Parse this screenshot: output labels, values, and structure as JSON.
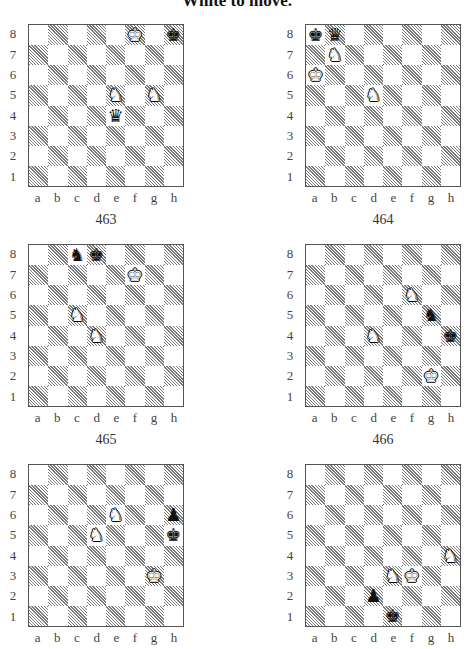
{
  "page": {
    "title": "White to move."
  },
  "labels": {
    "ranks": [
      "8",
      "7",
      "6",
      "5",
      "4",
      "3",
      "2",
      "1"
    ],
    "files": [
      "a",
      "b",
      "c",
      "d",
      "e",
      "f",
      "g",
      "h"
    ]
  },
  "piece_glyphs": {
    "white_king": "♔",
    "white_queen": "♕",
    "white_rook": "♖",
    "white_bishop": "♗",
    "white_knight": "♘",
    "white_pawn": "♙",
    "black_king": "♚",
    "black_queen": "♛",
    "black_rook": "♜",
    "black_bishop": "♝",
    "black_knight": "♞",
    "black_pawn": "♟"
  },
  "colors": {
    "light_square": "#ffffff",
    "dark_square_hatch": "#7a7a7a",
    "border": "#555555",
    "text": "#333333"
  },
  "diagrams": [
    {
      "number": "463",
      "position": {
        "left": 0,
        "top": 24
      },
      "pieces": [
        {
          "square": "f8",
          "piece": "white_king"
        },
        {
          "square": "h8",
          "piece": "black_king"
        },
        {
          "square": "e5",
          "piece": "white_knight"
        },
        {
          "square": "g5",
          "piece": "white_knight"
        },
        {
          "square": "e4",
          "piece": "black_queen"
        }
      ]
    },
    {
      "number": "464",
      "position": {
        "left": 277,
        "top": 24
      },
      "pieces": [
        {
          "square": "a8",
          "piece": "black_king"
        },
        {
          "square": "b8",
          "piece": "black_queen"
        },
        {
          "square": "b7",
          "piece": "white_knight"
        },
        {
          "square": "a6",
          "piece": "white_king"
        },
        {
          "square": "d5",
          "piece": "white_knight"
        }
      ]
    },
    {
      "number": "465",
      "position": {
        "left": 0,
        "top": 244
      },
      "pieces": [
        {
          "square": "c8",
          "piece": "black_knight"
        },
        {
          "square": "d8",
          "piece": "black_king"
        },
        {
          "square": "f7",
          "piece": "white_king"
        },
        {
          "square": "c5",
          "piece": "white_knight"
        },
        {
          "square": "d4",
          "piece": "white_knight"
        }
      ]
    },
    {
      "number": "466",
      "position": {
        "left": 277,
        "top": 244
      },
      "pieces": [
        {
          "square": "f6",
          "piece": "white_knight"
        },
        {
          "square": "g5",
          "piece": "black_knight"
        },
        {
          "square": "d4",
          "piece": "white_knight"
        },
        {
          "square": "h4",
          "piece": "black_king"
        },
        {
          "square": "g2",
          "piece": "white_king"
        }
      ]
    },
    {
      "number": "",
      "position": {
        "left": 0,
        "top": 464
      },
      "pieces": [
        {
          "square": "e6",
          "piece": "white_knight"
        },
        {
          "square": "h6",
          "piece": "black_pawn"
        },
        {
          "square": "d5",
          "piece": "white_knight"
        },
        {
          "square": "h5",
          "piece": "black_king"
        },
        {
          "square": "g3",
          "piece": "white_king"
        }
      ]
    },
    {
      "number": "",
      "position": {
        "left": 277,
        "top": 464
      },
      "pieces": [
        {
          "square": "h4",
          "piece": "white_knight"
        },
        {
          "square": "e3",
          "piece": "white_knight"
        },
        {
          "square": "f3",
          "piece": "white_king"
        },
        {
          "square": "d2",
          "piece": "black_pawn"
        },
        {
          "square": "e1",
          "piece": "black_king"
        }
      ]
    }
  ]
}
